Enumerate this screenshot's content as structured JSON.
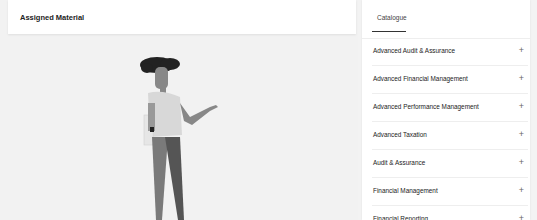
{
  "assigned": {
    "title": "Assigned Material"
  },
  "catalogue": {
    "tab_label": "Catalogue",
    "items": [
      {
        "label": "Advanced Audit & Assurance",
        "icon": "+"
      },
      {
        "label": "Advanced Financial Management",
        "icon": "+"
      },
      {
        "label": "Advanced Performance Management",
        "icon": "+"
      },
      {
        "label": "Advanced Taxation",
        "icon": "+"
      },
      {
        "label": "Audit & Assurance",
        "icon": "+"
      },
      {
        "label": "Financial Management",
        "icon": "+"
      },
      {
        "label": "Financial Reporting",
        "icon": "+"
      }
    ]
  }
}
